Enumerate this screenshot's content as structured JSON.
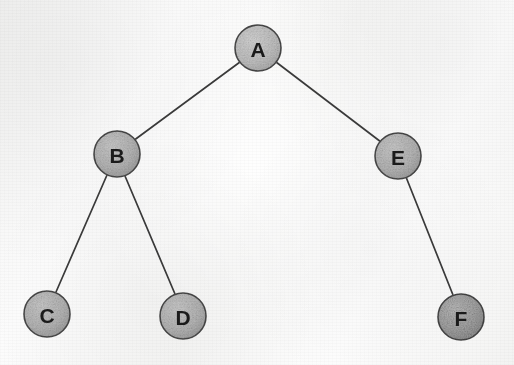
{
  "diagram": {
    "type": "binary-tree",
    "media": "scanned photocopy",
    "canvas": {
      "width": 514,
      "height": 365
    },
    "colors": {
      "background": "#f8f8f7",
      "node_fill": "#bdbdbd",
      "node_fill_dark": "#a8a8a8",
      "node_stroke": "#4a4a4a",
      "edge_stroke": "#3a3a3a",
      "label_color": "#1b1b1b"
    },
    "nodes": [
      {
        "id": "A",
        "label": "A",
        "cx": 258,
        "cy": 48,
        "r": 23,
        "level": 0,
        "shade": "light"
      },
      {
        "id": "B",
        "label": "B",
        "cx": 117,
        "cy": 154,
        "r": 23,
        "level": 1,
        "shade": "mid"
      },
      {
        "id": "E",
        "label": "E",
        "cx": 398,
        "cy": 156,
        "r": 23,
        "level": 1,
        "shade": "mid"
      },
      {
        "id": "C",
        "label": "C",
        "cx": 47,
        "cy": 314,
        "r": 23,
        "level": 2,
        "shade": "mid"
      },
      {
        "id": "D",
        "label": "D",
        "cx": 183,
        "cy": 316,
        "r": 23,
        "level": 2,
        "shade": "mid"
      },
      {
        "id": "F",
        "label": "F",
        "cx": 461,
        "cy": 317,
        "r": 23,
        "level": 2,
        "shade": "dark"
      }
    ],
    "edges": [
      {
        "id": "A-B",
        "from": "A",
        "to": "B",
        "x1": 240,
        "y1": 62,
        "x2": 133,
        "y2": 141
      },
      {
        "id": "A-E",
        "from": "A",
        "to": "E",
        "x1": 276,
        "y1": 62,
        "x2": 381,
        "y2": 142
      },
      {
        "id": "B-C",
        "from": "B",
        "to": "C",
        "x1": 107,
        "y1": 175,
        "x2": 56,
        "y2": 292
      },
      {
        "id": "B-D",
        "from": "B",
        "to": "D",
        "x1": 125,
        "y1": 176,
        "x2": 175,
        "y2": 294
      },
      {
        "id": "E-F",
        "from": "E",
        "to": "F",
        "x1": 406,
        "y1": 177,
        "x2": 453,
        "y2": 295
      }
    ],
    "root": "A",
    "traversal_structure": {
      "A": {
        "left": "B",
        "right": "E"
      },
      "B": {
        "left": "C",
        "right": "D"
      },
      "E": {
        "left": null,
        "right": "F"
      },
      "C": {
        "left": null,
        "right": null
      },
      "D": {
        "left": null,
        "right": null
      },
      "F": {
        "left": null,
        "right": null
      }
    }
  }
}
